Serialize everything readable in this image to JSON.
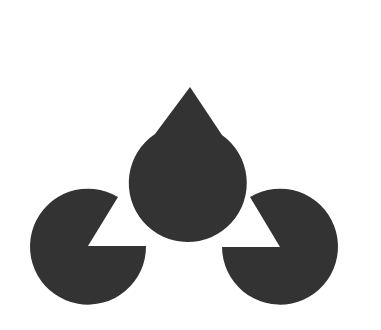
{
  "figure": {
    "title": "Kanizsa triangle illusion",
    "background": "#ffffff",
    "fill_color": "#333333",
    "inducers": [
      {
        "id": "top",
        "cx": 190,
        "cy": 87,
        "r": 59,
        "notch": [
          [
            155,
            134
          ],
          [
            190,
            87
          ],
          [
            222,
            135
          ]
        ]
      },
      {
        "id": "bottom-left",
        "cx": 88,
        "cy": 246,
        "r": 58,
        "notch": [
          [
            118,
            193
          ],
          [
            88,
            246
          ],
          [
            146,
            246
          ]
        ]
      },
      {
        "id": "bottom-right",
        "cx": 280,
        "cy": 247,
        "r": 58,
        "notch": [
          [
            222,
            247
          ],
          [
            280,
            247
          ],
          [
            251,
            193
          ]
        ]
      }
    ]
  }
}
